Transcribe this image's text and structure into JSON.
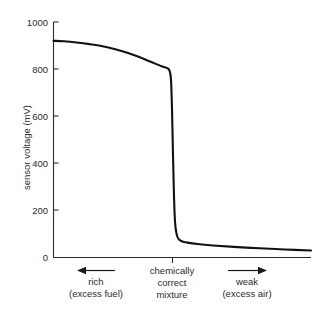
{
  "chart_data": {
    "type": "line",
    "title": "",
    "xlabel": "",
    "ylabel": "sensor voltage (mV)",
    "ylim": [
      0,
      1000
    ],
    "yticks": [
      0,
      200,
      400,
      600,
      800,
      1000
    ],
    "ytick_labels": [
      "0",
      "200",
      "400",
      "600",
      "800",
      "1000"
    ],
    "xlim": [
      0,
      100
    ],
    "xticks": [
      46
    ],
    "xtick_labels": [
      ""
    ],
    "grid": false,
    "legend": null,
    "series": [
      {
        "name": "sensor voltage",
        "x": [
          0,
          4,
          9,
          14,
          19,
          24,
          29,
          34,
          38,
          42,
          44,
          45,
          45.6,
          46.0,
          46.4,
          46.8,
          47.2,
          47.8,
          48.6,
          50,
          52,
          56,
          62,
          70,
          80,
          90,
          100
        ],
        "values": [
          920,
          918,
          913,
          906,
          897,
          884,
          868,
          848,
          830,
          812,
          805,
          795,
          760,
          640,
          440,
          260,
          150,
          100,
          78,
          68,
          63,
          57,
          51,
          45,
          39,
          34,
          30
        ]
      }
    ],
    "annotations": [
      {
        "name": "rich-region",
        "arrow": "left",
        "lines": [
          "rich",
          "(excess fuel)"
        ]
      },
      {
        "name": "stoichiometric-point",
        "arrow": "none",
        "lines": [
          "chemically",
          "correct",
          "mixture"
        ]
      },
      {
        "name": "weak-region",
        "arrow": "right",
        "lines": [
          "weak",
          "(excess air)"
        ]
      }
    ],
    "colors": {
      "background": "#ffffff",
      "curve": "#121212",
      "axis": "#2b2b2b",
      "text": "#2b2b2b"
    }
  }
}
